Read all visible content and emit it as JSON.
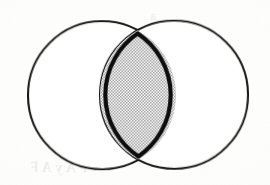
{
  "figure": {
    "type": "venn-diagram",
    "background_color": "#fdfdfc",
    "stroke_color": "#151515",
    "shade_color": "#b8b8b8",
    "shade_pattern": "halftone-checker-dots",
    "set_count": 2,
    "shaded_region_label": "intersection",
    "left_circle": {
      "cx": 102,
      "cy": 95,
      "r": 74,
      "label": ""
    },
    "right_circle": {
      "cx": 174,
      "cy": 95,
      "r": 74,
      "label": ""
    },
    "intersection_outline_weight": "heavy",
    "circle_outline_weight": "light"
  },
  "bleed_through": {
    "line1": "on lies a",
    "line2": "es for lo",
    "line3": "ind p",
    "line4": "a",
    "line5": "F A y A F",
    "line6": ""
  },
  "colors": {
    "paper": "#fdfdfc",
    "ink": "#151515",
    "shade": "#b8b8b8",
    "bleed": "#b9b6b0"
  }
}
